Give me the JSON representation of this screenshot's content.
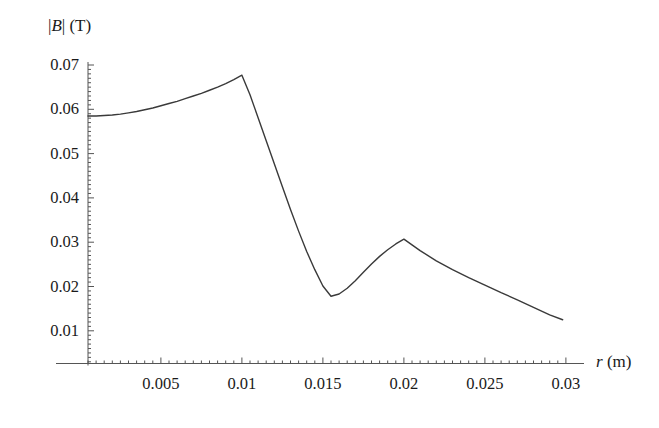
{
  "figure": {
    "background_color": "#ffffff",
    "curve_color": "#3a3a3a",
    "axis_color": "#555555"
  },
  "axis_titles": {
    "y_prefix": "|",
    "y_symbol": "B",
    "y_suffix": "| (T)",
    "y_full": "|B| (T)",
    "x_symbol": "r",
    "x_suffix": " (m)",
    "x_full": "r (m)"
  },
  "y_ticks": [
    {
      "label": "0.07",
      "value": 0.07
    },
    {
      "label": "0.06",
      "value": 0.06
    },
    {
      "label": "0.05",
      "value": 0.05
    },
    {
      "label": "0.04",
      "value": 0.04
    },
    {
      "label": "0.03",
      "value": 0.03
    },
    {
      "label": "0.02",
      "value": 0.02
    },
    {
      "label": "0.01",
      "value": 0.01
    }
  ],
  "x_ticks": [
    {
      "label": "0.005",
      "value": 0.005
    },
    {
      "label": "0.01",
      "value": 0.01
    },
    {
      "label": "0.015",
      "value": 0.015
    },
    {
      "label": "0.02",
      "value": 0.02
    },
    {
      "label": "0.025",
      "value": 0.025
    },
    {
      "label": "0.03",
      "value": 0.03
    }
  ],
  "chart_data": {
    "type": "line",
    "title": "",
    "xlabel": "r (m)",
    "ylabel": "|B| (T)",
    "xlim": [
      0.0,
      0.0305
    ],
    "ylim": [
      0.0,
      0.0735
    ],
    "grid": false,
    "legend": null,
    "series": [
      {
        "name": "|B|",
        "color": "#3a3a3a",
        "x": [
          0.0005,
          0.001,
          0.0015,
          0.002,
          0.0025,
          0.003,
          0.0035,
          0.004,
          0.0045,
          0.005,
          0.0055,
          0.006,
          0.0065,
          0.007,
          0.0075,
          0.008,
          0.0085,
          0.009,
          0.0095,
          0.01,
          0.0105,
          0.011,
          0.0115,
          0.012,
          0.0125,
          0.013,
          0.0135,
          0.014,
          0.0145,
          0.015,
          0.0155,
          0.016,
          0.0165,
          0.017,
          0.0175,
          0.018,
          0.0185,
          0.019,
          0.0195,
          0.02,
          0.0205,
          0.021,
          0.022,
          0.023,
          0.024,
          0.025,
          0.026,
          0.027,
          0.028,
          0.029,
          0.0298
        ],
        "y": [
          0.0585,
          0.0585,
          0.0586,
          0.0587,
          0.0589,
          0.0592,
          0.0595,
          0.0599,
          0.0603,
          0.0608,
          0.0613,
          0.0618,
          0.0624,
          0.063,
          0.0636,
          0.0643,
          0.065,
          0.0658,
          0.0667,
          0.0677,
          0.0633,
          0.0581,
          0.0529,
          0.0477,
          0.0425,
          0.0374,
          0.0325,
          0.0279,
          0.0238,
          0.0201,
          0.0178,
          0.0183,
          0.0196,
          0.0213,
          0.0232,
          0.0251,
          0.0268,
          0.0283,
          0.0296,
          0.0307,
          0.0294,
          0.0281,
          0.0258,
          0.0238,
          0.022,
          0.0203,
          0.0186,
          0.017,
          0.0153,
          0.0136,
          0.0125
        ]
      }
    ],
    "annotations": [
      {
        "name": "first-peak",
        "x": 0.01,
        "y": 0.0677,
        "label": ""
      },
      {
        "name": "minimum",
        "x": 0.0155,
        "y": 0.0178,
        "label": ""
      },
      {
        "name": "second-peak",
        "x": 0.02,
        "y": 0.0307,
        "label": ""
      }
    ]
  }
}
